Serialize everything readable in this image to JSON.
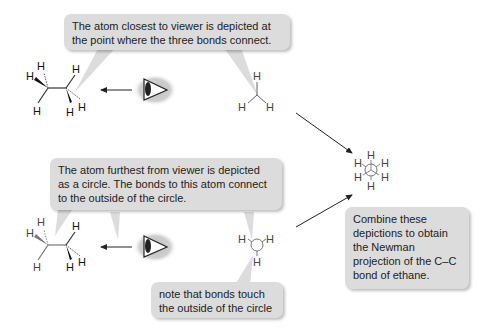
{
  "callouts": {
    "closest_atom": "The atom closest to viewer is depicted at the point where the three bonds connect.",
    "furthest_atom": "The atom furthest from viewer is depicted as a circle. The bonds to this atom connect to the outside of the circle.",
    "bond_note": "note that bonds touch the outside of the circle",
    "combine": "Combine these depictions to obtain the Newman projection of the C–C bond of ethane."
  },
  "atoms": {
    "hydrogen": "H"
  },
  "icons": {
    "viewer_eye_top": "eye-icon",
    "viewer_eye_bottom": "eye-icon",
    "arrow": "arrow-left-icon"
  },
  "colors": {
    "bubble": "#dcdcdc",
    "bond_front": "#222222",
    "bond_back": "#888888"
  }
}
